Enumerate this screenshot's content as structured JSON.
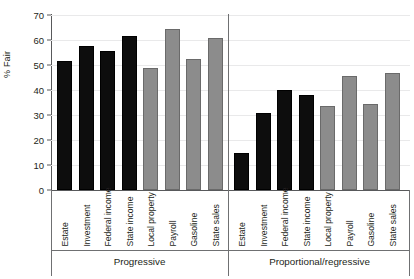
{
  "chart_data": {
    "type": "bar",
    "title": "",
    "xlabel": "",
    "ylabel": "% Fair",
    "ylim": [
      0,
      70
    ],
    "yticks": [
      0,
      10,
      20,
      30,
      40,
      50,
      60,
      70
    ],
    "grid": true,
    "legend": "none",
    "categories": [
      "Estate",
      "Investment",
      "Federal income",
      "State income",
      "Local property",
      "Payroll",
      "Gasoline",
      "State sales"
    ],
    "groups": [
      {
        "name": "Progressive",
        "values": [
          51.5,
          57.5,
          55.5,
          61.5,
          49.0,
          64.5,
          52.5,
          61.0
        ],
        "bar_colors": [
          "black",
          "black",
          "black",
          "black",
          "gray",
          "gray",
          "gray",
          "gray"
        ]
      },
      {
        "name": "Proportional/regressive",
        "values": [
          15.0,
          31.0,
          40.0,
          38.0,
          33.5,
          45.5,
          34.5,
          47.0
        ],
        "bar_colors": [
          "black",
          "black",
          "black",
          "black",
          "gray",
          "gray",
          "gray",
          "gray"
        ]
      }
    ],
    "colors": {
      "black_bar": "#0d0d0d",
      "gray_bar": "#8c8c8c",
      "gray_bar_outline": "#6a6a6a",
      "gridline": "#e9e9ea",
      "axis": "#58595b",
      "text": "#231f20",
      "background": "#ffffff"
    }
  }
}
